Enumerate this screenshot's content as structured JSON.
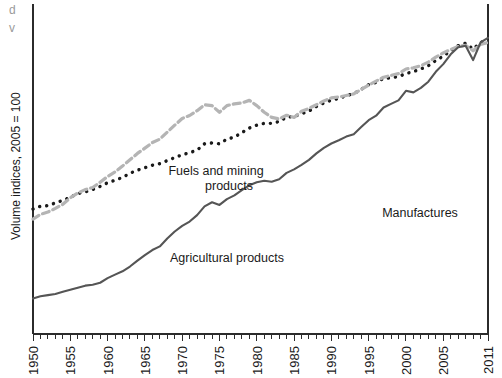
{
  "chart_data": {
    "type": "line",
    "title": "",
    "subtitle": "",
    "xlabel": "",
    "ylabel": "Volume indices, 2005 = 100",
    "y_scale": "logarithmic",
    "grid": false,
    "legend_position": "inline-annotations",
    "xlim": [
      1950,
      2011
    ],
    "ylim": [
      2,
      160
    ],
    "x_tick_labels": [
      "1950",
      "1955",
      "1960",
      "1965",
      "1970",
      "1975",
      "1980",
      "1985",
      "1990",
      "1995",
      "2000",
      "2005",
      "2011"
    ],
    "x_tick_values": [
      1950,
      1955,
      1960,
      1965,
      1970,
      1975,
      1980,
      1985,
      1990,
      1995,
      2000,
      2005,
      2011
    ],
    "x_minor_tick_step": 1,
    "y_tick_labels": [],
    "x": [
      1950,
      1951,
      1952,
      1953,
      1954,
      1955,
      1956,
      1957,
      1958,
      1959,
      1960,
      1961,
      1962,
      1963,
      1964,
      1965,
      1966,
      1967,
      1968,
      1969,
      1970,
      1971,
      1972,
      1973,
      1974,
      1975,
      1976,
      1977,
      1978,
      1979,
      1980,
      1981,
      1982,
      1983,
      1984,
      1985,
      1986,
      1987,
      1988,
      1989,
      1990,
      1991,
      1992,
      1993,
      1994,
      1995,
      1996,
      1997,
      1998,
      1999,
      2000,
      2001,
      2002,
      2003,
      2004,
      2005,
      2006,
      2007,
      2008,
      2009,
      2010,
      2011
    ],
    "series": [
      {
        "name": "Agricultural products",
        "color": "#1a1a1a",
        "style": "dotted",
        "label_x": 1972,
        "label_y": 15.5,
        "values": [
          10.5,
          10.9,
          11.0,
          11.4,
          11.8,
          12.3,
          12.9,
          13.2,
          13.6,
          14.2,
          14.9,
          15.4,
          16.0,
          16.9,
          17.6,
          18.2,
          18.8,
          19.2,
          20.0,
          20.8,
          21.6,
          22.2,
          23.0,
          25.0,
          25.3,
          25.0,
          26.6,
          27.3,
          29.0,
          30.8,
          32.0,
          32.8,
          32.8,
          33.6,
          35.6,
          35.9,
          37.2,
          38.6,
          41.0,
          43.0,
          44.6,
          45.6,
          47.4,
          48.6,
          51.5,
          54.8,
          56.5,
          59.5,
          60.0,
          61.0,
          63.5,
          65.2,
          67.5,
          70.5,
          75.5,
          80.0,
          86.0,
          92.0,
          95.0,
          88.0,
          96.0,
          100.0
        ]
      },
      {
        "name": "Fuels and mining products",
        "color": "#b4b4b4",
        "style": "dashed",
        "label_x": 1970,
        "label_y": 40.0,
        "values": [
          9.2,
          9.8,
          10.1,
          10.6,
          11.2,
          12.2,
          13.0,
          13.6,
          14.0,
          15.0,
          16.2,
          17.2,
          18.6,
          20.2,
          22.0,
          23.6,
          25.4,
          26.6,
          29.2,
          32.0,
          35.0,
          36.4,
          38.8,
          42.0,
          41.5,
          38.0,
          41.5,
          42.5,
          43.0,
          44.5,
          41.5,
          38.0,
          35.5,
          34.8,
          36.5,
          35.5,
          38.5,
          40.0,
          42.0,
          44.2,
          46.0,
          46.5,
          47.5,
          48.5,
          51.5,
          54.5,
          57.5,
          60.5,
          62.0,
          63.5,
          67.5,
          68.5,
          70.5,
          74.0,
          79.0,
          83.5,
          87.5,
          91.0,
          92.5,
          86.0,
          93.5,
          96.0
        ]
      },
      {
        "name": "Manufactures",
        "color": "#555555",
        "style": "solid",
        "label_x": 1996,
        "label_y": 27.0,
        "values": [
          3.2,
          3.3,
          3.35,
          3.4,
          3.5,
          3.6,
          3.7,
          3.8,
          3.85,
          3.95,
          4.2,
          4.4,
          4.6,
          4.9,
          5.3,
          5.7,
          6.1,
          6.4,
          7.1,
          7.8,
          8.4,
          8.9,
          9.7,
          10.9,
          11.5,
          11.1,
          12.0,
          12.6,
          13.5,
          14.4,
          15.0,
          15.3,
          15.1,
          15.6,
          17.0,
          17.8,
          18.9,
          20.2,
          22.0,
          23.7,
          25.1,
          26.2,
          27.5,
          28.4,
          31.2,
          34.2,
          36.3,
          40.5,
          42.5,
          44.5,
          50.5,
          49.5,
          52.5,
          57.0,
          65.0,
          72.0,
          82.0,
          90.0,
          92.0,
          76.0,
          96.0,
          102.0
        ]
      }
    ],
    "annotations": [
      {
        "text": "Fuels and mining",
        "x": 216,
        "y": 175
      },
      {
        "text": "products",
        "x": 229,
        "y": 190
      },
      {
        "text": "Agricultural products",
        "x": 227,
        "y": 262
      },
      {
        "text": "Manufactures",
        "x": 420,
        "y": 217
      }
    ],
    "clipped_top_text": [
      "d",
      "v"
    ]
  },
  "plot": {
    "left": 33,
    "right": 488,
    "top": 4,
    "bottom": 334
  }
}
